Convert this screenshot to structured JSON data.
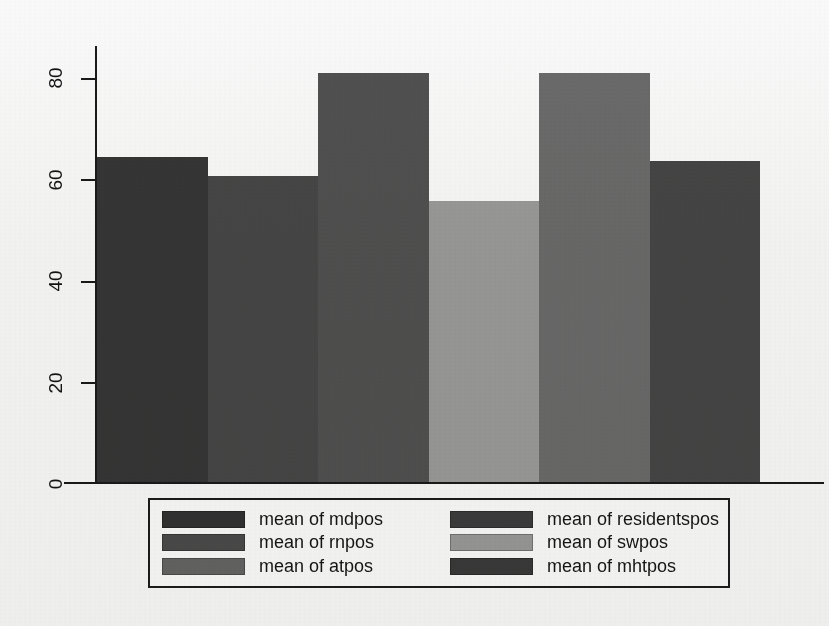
{
  "chart_data": {
    "type": "bar",
    "title": "",
    "subtitle": "",
    "xlabel": "",
    "ylabel": "",
    "categories": [
      "mdpos",
      "rnpos",
      "atpos",
      "swpos",
      "residentspos",
      "mhtpos"
    ],
    "values": [
      66,
      62,
      83,
      57,
      83,
      65
    ],
    "ylim": [
      0,
      88
    ],
    "yticks": [
      0,
      20,
      40,
      60,
      80
    ],
    "ytick_labels": [
      "0",
      "20",
      "40",
      "60",
      "80"
    ],
    "grid": false,
    "legend_position": "bottom",
    "series": [
      {
        "name": "mean of mdpos",
        "value": 66,
        "color": "#363636"
      },
      {
        "name": "mean of rnpos",
        "value": 62,
        "color": "#474747"
      },
      {
        "name": "mean of atpos",
        "value": 83,
        "color": "#515151"
      },
      {
        "name": "mean of swpos",
        "value": 57,
        "color": "#9b9b9b"
      },
      {
        "name": "mean of residentspos",
        "value": 83,
        "color": "#6b6b6b"
      },
      {
        "name": "mean of mhtpos",
        "value": 65,
        "color": "#464646"
      }
    ]
  },
  "axis": {
    "y_tick_labels": [
      "80",
      "60",
      "40",
      "20",
      "0"
    ]
  },
  "legend": {
    "left_column": [
      {
        "label": "mean of mdpos",
        "color": "#323232"
      },
      {
        "label": "mean of rnpos",
        "color": "#4b4b4b"
      },
      {
        "label": "mean of atpos",
        "color": "#656565"
      }
    ],
    "right_column": [
      {
        "label": "mean of residentspos",
        "color": "#3d3d3d"
      },
      {
        "label": "mean of swpos",
        "color": "#9a9a9a"
      },
      {
        "label": "mean of mhtpos",
        "color": "#3a3a3a"
      }
    ]
  },
  "colors": {
    "background": "#fbfbfb",
    "axis": "#1a1a1a",
    "text": "#141414",
    "legend_border": "#1c1c1c"
  }
}
